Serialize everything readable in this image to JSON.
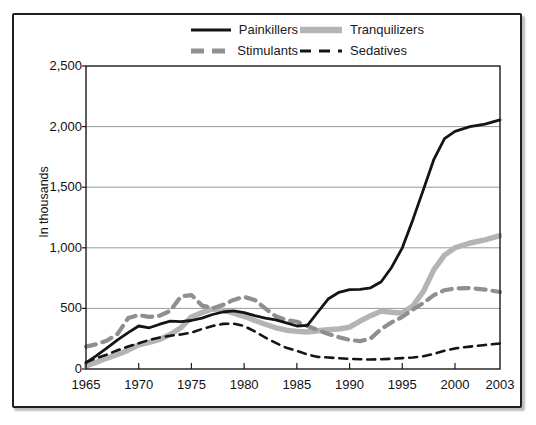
{
  "chart_data": {
    "type": "line",
    "title": "",
    "xlabel": "",
    "ylabel": "In thousands",
    "xlim": [
      1965,
      2003
    ],
    "ylim": [
      0,
      2500
    ],
    "grid": "horizontal",
    "legend_position": "top",
    "x_ticks": [
      1965,
      1970,
      1975,
      1980,
      1985,
      1990,
      1995,
      2000,
      2003
    ],
    "y_ticks": [
      0,
      500,
      1000,
      1500,
      2000,
      2500
    ],
    "y_tick_labels": [
      "0",
      "500",
      "1,000",
      "1,500",
      "2,000",
      "2,500"
    ],
    "x": [
      1965,
      1966,
      1967,
      1968,
      1969,
      1970,
      1971,
      1972,
      1973,
      1974,
      1975,
      1976,
      1977,
      1978,
      1979,
      1980,
      1981,
      1982,
      1983,
      1984,
      1985,
      1986,
      1987,
      1988,
      1989,
      1990,
      1991,
      1992,
      1993,
      1994,
      1995,
      1996,
      1997,
      1998,
      1999,
      2000,
      2001,
      2002,
      2003
    ],
    "series": [
      {
        "name": "Painkillers",
        "color": "#141414",
        "dash": "none",
        "width": 2.8,
        "legend_width": 3.2,
        "z": 4,
        "values": [
          50,
          110,
          175,
          240,
          300,
          355,
          340,
          370,
          395,
          390,
          400,
          420,
          450,
          470,
          480,
          465,
          440,
          420,
          405,
          380,
          355,
          360,
          470,
          580,
          633,
          655,
          657,
          670,
          720,
          840,
          1000,
          1230,
          1480,
          1730,
          1900,
          1960,
          2000,
          2020,
          2055
        ]
      },
      {
        "name": "Tranquilizers",
        "color": "#b4b4b4",
        "dash": "none",
        "width": 5.4,
        "legend_width": 6.5,
        "z": 1,
        "values": [
          25,
          55,
          90,
          120,
          155,
          200,
          220,
          245,
          285,
          340,
          430,
          465,
          495,
          485,
          460,
          435,
          400,
          370,
          340,
          320,
          310,
          305,
          315,
          325,
          330,
          345,
          395,
          440,
          478,
          468,
          462,
          520,
          640,
          820,
          940,
          1000,
          1040,
          1065,
          1100
        ]
      },
      {
        "name": "Stimulants",
        "color": "#8f8f8f",
        "dash": "10 7",
        "legend_dash": "13 8",
        "width": 4.2,
        "legend_width": 5,
        "z": 2,
        "values": [
          185,
          205,
          235,
          290,
          420,
          445,
          430,
          440,
          480,
          600,
          610,
          525,
          500,
          530,
          570,
          595,
          570,
          500,
          435,
          405,
          390,
          355,
          320,
          290,
          262,
          240,
          230,
          252,
          330,
          385,
          430,
          490,
          545,
          610,
          650,
          665,
          668,
          655,
          635
        ]
      },
      {
        "name": "Sedatives",
        "color": "#141414",
        "dash": "8 6",
        "legend_dash": "11 8",
        "width": 2.6,
        "legend_width": 3,
        "z": 3,
        "values": [
          55,
          90,
          120,
          155,
          185,
          212,
          240,
          260,
          275,
          285,
          300,
          330,
          355,
          372,
          375,
          355,
          310,
          260,
          215,
          175,
          150,
          120,
          100,
          95,
          88,
          84,
          80,
          78,
          80,
          85,
          90,
          95,
          105,
          125,
          150,
          170,
          185,
          198,
          210
        ]
      }
    ]
  }
}
